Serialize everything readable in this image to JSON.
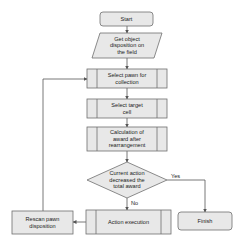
{
  "diagram": {
    "type": "flowchart",
    "colors": {
      "node_fill": "#e8e8e8",
      "node_stroke": "#6e6e6e",
      "edge": "#555555",
      "text": "#222222"
    },
    "nodes": {
      "start": {
        "label": "Start",
        "shape": "rounded-rect"
      },
      "get_disposition": {
        "label": "Get object\ndisposition on\nthe field",
        "shape": "parallelogram"
      },
      "select_pawn": {
        "label": "Select pawn for\ncollection",
        "shape": "predefined-process"
      },
      "select_target": {
        "label": "Select target\ncell",
        "shape": "predefined-process"
      },
      "calc_award": {
        "label": "Calculation of\naward after\nrearrangement",
        "shape": "predefined-process"
      },
      "decision": {
        "label": "Current action\ndecreased the\ntotal award",
        "shape": "diamond"
      },
      "action_exec": {
        "label": "Action execution",
        "shape": "predefined-process"
      },
      "rescan": {
        "label": "Rescan pawn\ndisposition",
        "shape": "rect"
      },
      "finish": {
        "label": "Finish",
        "shape": "rounded-rect"
      }
    },
    "edges": [
      {
        "from": "start",
        "to": "get_disposition",
        "label": ""
      },
      {
        "from": "get_disposition",
        "to": "select_pawn",
        "label": ""
      },
      {
        "from": "select_pawn",
        "to": "select_target",
        "label": ""
      },
      {
        "from": "select_target",
        "to": "calc_award",
        "label": ""
      },
      {
        "from": "calc_award",
        "to": "decision",
        "label": ""
      },
      {
        "from": "decision",
        "to": "finish",
        "label": "Yes"
      },
      {
        "from": "decision",
        "to": "action_exec",
        "label": "No"
      },
      {
        "from": "action_exec",
        "to": "rescan",
        "label": ""
      },
      {
        "from": "rescan",
        "to": "select_pawn",
        "label": ""
      }
    ],
    "edge_labels": {
      "yes": "Yes",
      "no": "No"
    }
  }
}
